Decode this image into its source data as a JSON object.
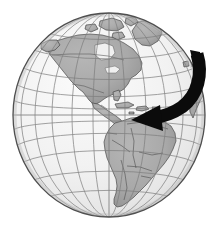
{
  "figure": {
    "name": "globe-americas-with-rotation-arrow",
    "title": "Globe showing the Americas with a curved black arrow",
    "background_color": "#ffffff",
    "width": 220,
    "height": 231
  },
  "globe": {
    "label": "Earth globe",
    "center_x": 109,
    "center_y": 115,
    "radius_x": 96,
    "radius_y": 102,
    "ocean_color": "#f2f2f2",
    "ocean_shade_color": "#e2e2e2",
    "land_color": "#a9a9a9",
    "land_light_color": "#bdbdbd",
    "outline_color": "#3a3a3a",
    "border_color": "#5a5a5a",
    "graticule_color": "#8a8a8a",
    "graticule_spacing_degrees": 15,
    "center_longitude": -75,
    "center_latitude": 0
  },
  "graticule": {
    "label": "latitude and longitude grid",
    "meridian_offsets": [
      -90,
      -75,
      -60,
      -45,
      -30,
      -15,
      0,
      15,
      30,
      45,
      60,
      75,
      90
    ],
    "parallel_latitudes": [
      -75,
      -60,
      -45,
      -30,
      -15,
      0,
      15,
      30,
      45,
      60,
      75
    ],
    "equator_latitude": 0,
    "prime_meridian_offset": 0
  },
  "landmasses": [
    {
      "name": "north-america",
      "label": "North America"
    },
    {
      "name": "greenland",
      "label": "Greenland"
    },
    {
      "name": "canadian-arctic",
      "label": "Canadian Arctic Islands"
    },
    {
      "name": "alaska",
      "label": "Alaska"
    },
    {
      "name": "central-america",
      "label": "Central America"
    },
    {
      "name": "caribbean-islands",
      "label": "Caribbean Islands"
    },
    {
      "name": "south-america",
      "label": "South America"
    },
    {
      "name": "western-europe-africa-sliver",
      "label": "Western Europe and Africa edge"
    }
  ],
  "arrow": {
    "name": "rotation-arrow",
    "label": "Curved arrow pointing west",
    "color": "#0b0b0b",
    "direction": "right-to-left",
    "tail_x": 196,
    "tail_y": 58,
    "head_x": 131,
    "head_y": 120,
    "stroke_width": 13
  }
}
